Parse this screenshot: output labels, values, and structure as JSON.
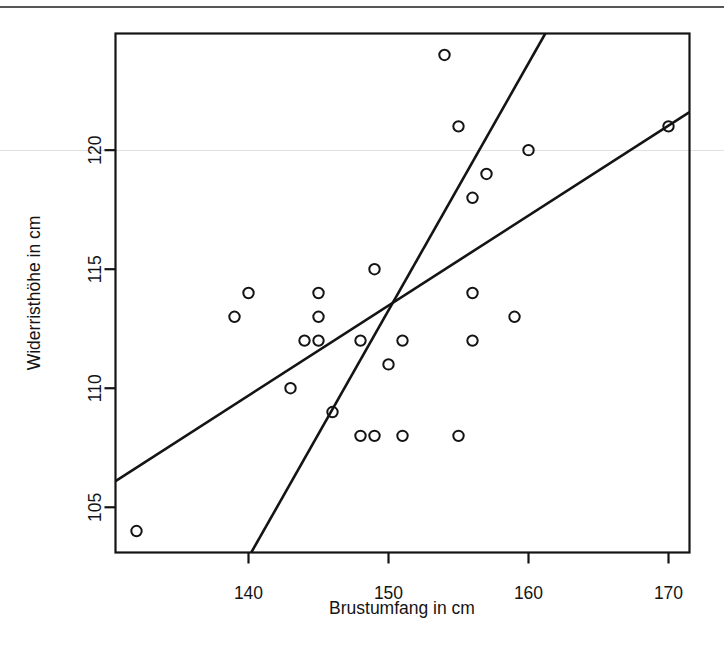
{
  "figure": {
    "kind": "scatterplot-with-two-regression-lines",
    "background_color": "#ffffff",
    "foreground_color": "#141414"
  },
  "axes": {
    "x_label": "Brustumfang in cm",
    "y_label": "Widerristhöhe in cm",
    "x_ticks": [
      "140",
      "150",
      "160",
      "170"
    ],
    "y_ticks": [
      "105",
      "110",
      "115",
      "120"
    ]
  },
  "chart_data": {
    "type": "scatter",
    "title": "",
    "xlabel": "Brustumfang in cm",
    "ylabel": "Widerristhöhe in cm",
    "xlim": [
      130.5,
      171.5
    ],
    "ylim": [
      103.1,
      124.9
    ],
    "x_ticks": [
      140,
      150,
      160,
      170
    ],
    "y_ticks": [
      105,
      110,
      115,
      120
    ],
    "grid": false,
    "legend": "none",
    "marker": "open-circle",
    "points": [
      {
        "x": 132,
        "y": 104
      },
      {
        "x": 139,
        "y": 113
      },
      {
        "x": 140,
        "y": 114
      },
      {
        "x": 143,
        "y": 110
      },
      {
        "x": 144,
        "y": 112
      },
      {
        "x": 145,
        "y": 112
      },
      {
        "x": 145,
        "y": 113
      },
      {
        "x": 145,
        "y": 114
      },
      {
        "x": 146,
        "y": 109
      },
      {
        "x": 148,
        "y": 108
      },
      {
        "x": 148,
        "y": 112
      },
      {
        "x": 149,
        "y": 108
      },
      {
        "x": 149,
        "y": 115
      },
      {
        "x": 150,
        "y": 111
      },
      {
        "x": 151,
        "y": 108
      },
      {
        "x": 151,
        "y": 112
      },
      {
        "x": 154,
        "y": 124
      },
      {
        "x": 155,
        "y": 108
      },
      {
        "x": 155,
        "y": 121
      },
      {
        "x": 156,
        "y": 112
      },
      {
        "x": 156,
        "y": 114
      },
      {
        "x": 156,
        "y": 118
      },
      {
        "x": 157,
        "y": 119
      },
      {
        "x": 159,
        "y": 113
      },
      {
        "x": 160,
        "y": 120
      },
      {
        "x": 170,
        "y": 121
      }
    ],
    "lines": [
      {
        "name": "shallow-regression-line",
        "x1": 130.5,
        "y1": 106.1,
        "x2": 171.5,
        "y2": 121.6
      },
      {
        "name": "steep-regression-line",
        "x1": 140.2,
        "y1": 103.1,
        "x2": 161.2,
        "y2": 124.9
      }
    ],
    "lines_intersection": {
      "x": 151.0,
      "y": 113.4
    }
  }
}
